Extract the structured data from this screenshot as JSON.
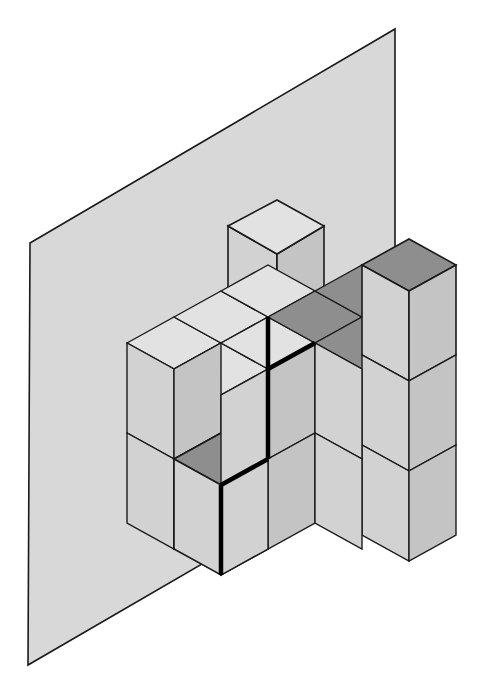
{
  "figure": {
    "title": "Isometric unit-cube stack against a backing plane",
    "type": "isometric-block-diagram",
    "canvas": {
      "width": 499,
      "height": 693,
      "background": "#ffffff"
    },
    "colors": {
      "plane_fill": "#d8d8d8",
      "top_face_light": "#e2e2e2",
      "top_face_shaded": "#8e8e8e",
      "left_face": "#d2d2d2",
      "right_face": "#c4c4c4",
      "outline": "#1a1a1a",
      "highlight_edge": "#000000"
    },
    "projection": {
      "origin_x": 127,
      "origin_y": 343,
      "axis_x_screen": [
        46.5,
        -26.0
      ],
      "axis_y_screen": [
        46.5,
        26.0
      ],
      "axis_z_screen": [
        0,
        -90
      ],
      "cube_edge_px": 53,
      "description": "Isometric: +X goes right-and-up, +Y goes right-and-down, +Z goes straight up."
    },
    "backing_plane": {
      "name": "background-plane",
      "points": "30,243 395,29 395,452 28,665",
      "fill": "#d8d8d8",
      "stroke": "#1a1a1a"
    },
    "counts": {
      "total_cubes": 18,
      "shaded_top_faces": 6,
      "highlighted_edges": 3
    },
    "cubes": [
      {
        "id": "c01",
        "x": 0,
        "y": 0,
        "z": 1,
        "top": "light"
      },
      {
        "id": "c02",
        "x": 1,
        "y": 0,
        "z": 1,
        "top": "light"
      },
      {
        "id": "c03",
        "x": 2,
        "y": 0,
        "z": 1,
        "top": "light"
      },
      {
        "id": "c04",
        "x": 2,
        "y": 0,
        "z": 2,
        "top": "light"
      },
      {
        "id": "c05",
        "x": 0,
        "y": 0,
        "z": 0,
        "top": "light"
      },
      {
        "id": "c06",
        "x": 1,
        "y": 0,
        "z": 0,
        "top": "light"
      },
      {
        "id": "c07",
        "x": 3,
        "y": 0,
        "z": 1,
        "top": "shaded"
      },
      {
        "id": "c08",
        "x": 4,
        "y": 0,
        "z": 1,
        "top": "shaded"
      },
      {
        "id": "c09",
        "x": 3,
        "y": 1,
        "z": 1,
        "top": "shaded"
      },
      {
        "id": "c10",
        "x": 4,
        "y": 1,
        "z": 1,
        "top": "shaded"
      },
      {
        "id": "c11",
        "x": 5,
        "y": 0,
        "z": 1,
        "top": "light"
      },
      {
        "id": "c12",
        "x": 5,
        "y": 0,
        "z": 2,
        "top": "shaded"
      },
      {
        "id": "c13",
        "x": 5,
        "y": 1,
        "z": 1,
        "top": "light"
      },
      {
        "id": "c14",
        "x": 3,
        "y": 1,
        "z": 0,
        "top": "light"
      },
      {
        "id": "c15",
        "x": 4,
        "y": 1,
        "z": 0,
        "top": "light"
      },
      {
        "id": "c16",
        "x": 5,
        "y": 1,
        "z": 0,
        "top": "light"
      },
      {
        "id": "c17",
        "x": 2,
        "y": 1,
        "z": 0,
        "top": "shaded"
      },
      {
        "id": "c18",
        "x": 3,
        "y": 0,
        "z": 0,
        "top": "light"
      }
    ],
    "faces": [
      {
        "name": "plane-face",
        "kind": "plane",
        "points": "30,243 395,29 395,452 28,665",
        "fill": "#d8d8d8",
        "stroke": "#1a1a1a",
        "w": 1
      },
      {
        "name": "top-cube-left-face",
        "kind": "left",
        "points": "228,226 228,316 277,344 277,254",
        "fill": "#d2d2d2",
        "stroke": "#1a1a1a",
        "w": 1.6
      },
      {
        "name": "top-cube-right-face",
        "kind": "right",
        "points": "277,254 277,344 324,316 324,226",
        "fill": "#c4c4c4",
        "stroke": "#1a1a1a",
        "w": 1.6
      },
      {
        "name": "top-cube-top-face",
        "kind": "top",
        "points": "228,226 277,200 324,226 277,254",
        "fill": "#e2e2e2",
        "stroke": "#1a1a1a",
        "w": 1.6
      },
      {
        "name": "rear-left-top-row-top-a",
        "kind": "top",
        "points": "127,343 174,317 221,343 174,369",
        "fill": "#e2e2e2",
        "stroke": "#1a1a1a",
        "w": 1.4
      },
      {
        "name": "rear-left-top-row-top-b",
        "kind": "top",
        "points": "174,317 221,291 268,317 221,343",
        "fill": "#e2e2e2",
        "stroke": "#1a1a1a",
        "w": 1.4
      },
      {
        "name": "rear-left-top-row-top-c",
        "kind": "top",
        "points": "221,291 268,265 315,291 268,317",
        "fill": "#e2e2e2",
        "stroke": "#1a1a1a",
        "w": 1.4
      },
      {
        "name": "rear-left-top-row-top-d",
        "kind": "top",
        "points": "174,369 221,343 268,369 221,395",
        "fill": "#e2e2e2",
        "stroke": "#1a1a1a",
        "w": 1.4
      },
      {
        "name": "rear-left-top-row-top-e",
        "kind": "top",
        "points": "221,343 268,317 315,343 268,369",
        "fill": "#e2e2e2",
        "stroke": "#1a1a1a",
        "w": 1.4
      },
      {
        "name": "left-col-face-upper",
        "kind": "left",
        "points": "127,343 127,433 174,459 174,369",
        "fill": "#d2d2d2",
        "stroke": "#1a1a1a",
        "w": 1.4
      },
      {
        "name": "left-col-face-lower",
        "kind": "left",
        "points": "127,433 127,523 174,549 174,459",
        "fill": "#d2d2d2",
        "stroke": "#1a1a1a",
        "w": 1.4
      },
      {
        "name": "mid-step-top",
        "kind": "top",
        "points": "174,459 221,433 268,459 221,485",
        "fill": "#e2e2e2",
        "stroke": "#1a1a1a",
        "w": 1.4
      },
      {
        "name": "front-left-upper-face",
        "kind": "right",
        "points": "174,369 174,459 221,433 221,343",
        "fill": "#c4c4c4",
        "stroke": "#1a1a1a",
        "w": 1.4
      },
      {
        "name": "front-left-lower-face",
        "kind": "right",
        "points": "174,459 174,549 221,523 221,433",
        "fill": "#c4c4c4",
        "stroke": "#1a1a1a",
        "w": 1.4
      },
      {
        "name": "shaded-step-top",
        "kind": "top",
        "points": "174,459 221,485 268,459 221,433",
        "fill": "#8e8e8e",
        "stroke": "#1a1a1a",
        "w": 1.6
      },
      {
        "name": "shaded-step-left",
        "kind": "left",
        "points": "174,459 174,549 221,575 221,485",
        "fill": "#d2d2d2",
        "stroke": "#1a1a1a",
        "w": 1.6
      },
      {
        "name": "shaded-step-right",
        "kind": "right",
        "points": "221,485 221,575 268,549 268,459",
        "fill": "#c4c4c4",
        "stroke": "#1a1a1a",
        "w": 1.6
      },
      {
        "name": "shaded-plateau-a",
        "kind": "top",
        "points": "268,317 315,291 362,317 315,343",
        "fill": "#8e8e8e",
        "stroke": "#1a1a1a",
        "w": 1.4
      },
      {
        "name": "shaded-plateau-b",
        "kind": "top",
        "points": "315,291 362,265 409,291 362,317",
        "fill": "#8e8e8e",
        "stroke": "#1a1a1a",
        "w": 1.4
      },
      {
        "name": "shaded-plateau-c",
        "kind": "top",
        "points": "268,369 315,343 362,369 315,395",
        "fill": "#8e8e8e",
        "stroke": "#1a1a1a",
        "w": 1.4
      },
      {
        "name": "shaded-plateau-d",
        "kind": "top",
        "points": "315,343 362,317 409,343 362,369",
        "fill": "#8e8e8e",
        "stroke": "#1a1a1a",
        "w": 1.4
      },
      {
        "name": "mid-front-face-upper-a",
        "kind": "right",
        "points": "268,369 268,459 315,433 315,343",
        "fill": "#c4c4c4",
        "stroke": "#1a1a1a",
        "w": 1.4
      },
      {
        "name": "mid-front-face-upper-b",
        "kind": "left",
        "points": "268,369 268,459 221,485 221,395",
        "fill": "#d2d2d2",
        "stroke": "#1a1a1a",
        "w": 1.4
      },
      {
        "name": "mid-front-face-lower-a",
        "kind": "right",
        "points": "268,459 268,549 315,523 315,433",
        "fill": "#c4c4c4",
        "stroke": "#1a1a1a",
        "w": 1.4
      },
      {
        "name": "mid-front-face-lower-b",
        "kind": "left",
        "points": "268,459 268,549 221,575 221,485",
        "fill": "#d2d2d2",
        "stroke": "#1a1a1a",
        "w": 1.4
      },
      {
        "name": "right-tower-top",
        "kind": "top",
        "points": "362,265 409,239 456,265 409,291",
        "fill": "#8e8e8e",
        "stroke": "#1a1a1a",
        "w": 1.6
      },
      {
        "name": "right-tower-left",
        "kind": "left",
        "points": "362,265 362,355 409,381 409,291",
        "fill": "#d2d2d2",
        "stroke": "#1a1a1a",
        "w": 1.6
      },
      {
        "name": "right-tower-right",
        "kind": "right",
        "points": "409,291 409,381 456,355 456,265",
        "fill": "#c4c4c4",
        "stroke": "#1a1a1a",
        "w": 1.6
      },
      {
        "name": "right-block-left-mid",
        "kind": "left",
        "points": "362,355 362,445 409,471 409,381",
        "fill": "#d2d2d2",
        "stroke": "#1a1a1a",
        "w": 1.4
      },
      {
        "name": "right-block-right-mid",
        "kind": "right",
        "points": "409,381 409,471 456,445 456,355",
        "fill": "#c4c4c4",
        "stroke": "#1a1a1a",
        "w": 1.4
      },
      {
        "name": "right-block-left-low",
        "kind": "left",
        "points": "362,445 362,535 409,561 409,471",
        "fill": "#d2d2d2",
        "stroke": "#1a1a1a",
        "w": 1.4
      },
      {
        "name": "right-block-right-low",
        "kind": "right",
        "points": "409,471 409,561 456,535 456,445",
        "fill": "#c4c4c4",
        "stroke": "#1a1a1a",
        "w": 1.4
      },
      {
        "name": "front-right-face-a",
        "kind": "left",
        "points": "315,343 315,433 362,459 362,369",
        "fill": "#d2d2d2",
        "stroke": "#1a1a1a",
        "w": 1.4
      },
      {
        "name": "front-right-face-b",
        "kind": "left",
        "points": "315,433 315,523 362,549 362,459",
        "fill": "#d2d2d2",
        "stroke": "#1a1a1a",
        "w": 1.4
      }
    ],
    "highlight_edges": [
      {
        "name": "highlight-vertical-main",
        "x1": 268,
        "y1": 369,
        "x2": 268,
        "y2": 459,
        "w": 4.5
      },
      {
        "name": "highlight-vertical-step",
        "x1": 221,
        "y1": 485,
        "x2": 221,
        "y2": 575,
        "w": 4.5
      },
      {
        "name": "highlight-diagonal-top",
        "x1": 268,
        "y1": 369,
        "x2": 315,
        "y2": 343,
        "w": 4.5
      },
      {
        "name": "highlight-diagonal-step",
        "x1": 221,
        "y1": 485,
        "x2": 268,
        "y2": 459,
        "w": 4.5
      },
      {
        "name": "highlight-diagonal-upper",
        "x1": 268,
        "y1": 317,
        "x2": 268,
        "y2": 369,
        "w": 4.5
      },
      {
        "name": "highlight-connector",
        "x1": 221,
        "y1": 459,
        "x2": 268,
        "y2": 459,
        "w": 0
      }
    ]
  }
}
